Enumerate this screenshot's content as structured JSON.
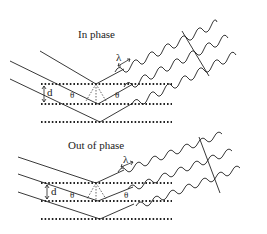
{
  "panels": [
    {
      "title": "In phase",
      "labels": {
        "d": "d",
        "theta_left": "θ",
        "theta_right": "θ",
        "lambda": "λ"
      }
    },
    {
      "title": "Out of phase",
      "labels": {
        "d": "d",
        "theta_left": "θ",
        "theta_right": "θ",
        "lambda": "λ"
      }
    }
  ],
  "colors": {
    "line": "#222222",
    "background": "#ffffff"
  }
}
